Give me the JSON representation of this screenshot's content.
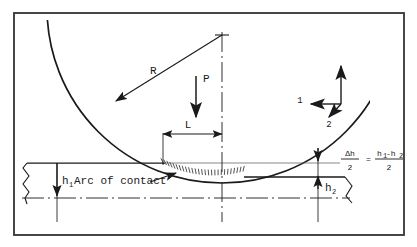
{
  "figure": {
    "border_color": "#333333",
    "line_color": "#1a1a1a",
    "background": "#ffffff"
  },
  "labels": {
    "radius": "R",
    "force": "P",
    "contact_length": "L",
    "entry_thickness": "h",
    "entry_thickness_sub": "1",
    "exit_thickness": "h",
    "exit_thickness_sub": "2",
    "arc_of_contact": "Arc of contact",
    "axis_1": "1",
    "axis_2": "2"
  },
  "formula": {
    "lhs_numerator": "Δh",
    "lhs_denominator": "2",
    "equals": "=",
    "rhs_numerator_h": "h",
    "rhs_numerator_sub1": "1",
    "rhs_numerator_minus": "-h",
    "rhs_numerator_sub2": "2",
    "rhs_denominator": "2",
    "full_text": "Δh/2 = (h1-h2)/2"
  },
  "geometry": {
    "roll_radius_px": 175,
    "roll_center_x": 222,
    "roll_center_y": 8,
    "arc_bottom_x": 222,
    "arc_bottom_y": 183,
    "strip_top_y": 163,
    "strip_exit_y": 177,
    "strip_centerline_y": 198,
    "L_left_x": 163,
    "L_right_x": 222,
    "centerline_x": 222,
    "h1_arrow_x": 57,
    "h2_arrow_x": 318
  }
}
